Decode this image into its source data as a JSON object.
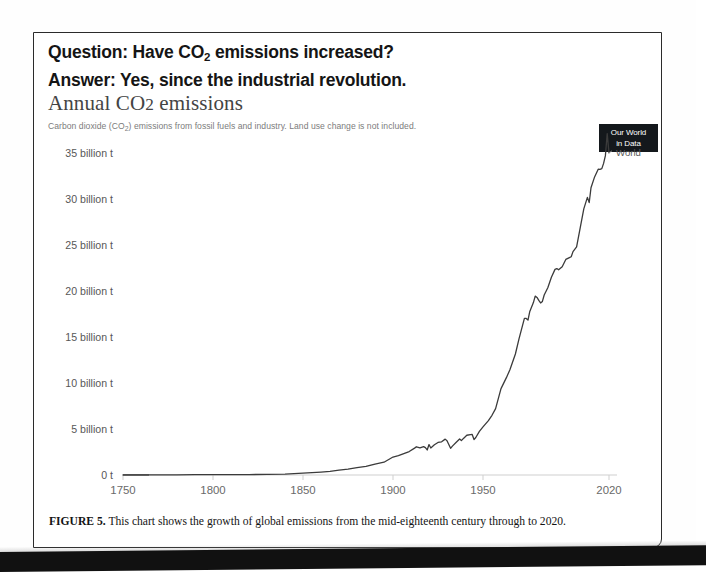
{
  "header": {
    "question_prefix": "Question: Have CO",
    "question_sub": "2",
    "question_suffix": " emissions increased?",
    "answer": "Answer: Yes, since the industrial revolution."
  },
  "chart": {
    "title_prefix": "Annual CO",
    "title_sub": "2",
    "title_suffix": " emissions",
    "subtitle_prefix": "Carbon dioxide (CO",
    "subtitle_sub": "2",
    "subtitle_suffix": ") emissions from fossil fuels and industry. Land use change is not included.",
    "logo_line1": "Our World",
    "logo_line2": "in Data",
    "series_label": "World",
    "line_color": "#3b3b3b",
    "axis_color": "#cfcfcf",
    "baseline_color": "#5a5a5a"
  },
  "caption": {
    "figure_number": "FIGURE 5.",
    "text": " This chart shows the growth of global emissions from the mid-eighteenth century through to 2020."
  },
  "chart_data": {
    "type": "line",
    "title": "Annual CO2 emissions",
    "subtitle": "Carbon dioxide (CO2) emissions from fossil fuels and industry. Land use change is not included.",
    "xlabel": "",
    "ylabel": "",
    "xlim": [
      1750,
      2020
    ],
    "ylim": [
      0,
      37.5
    ],
    "grid": false,
    "legend_position": "right-end-label",
    "x_ticks": [
      1750,
      1800,
      1850,
      1900,
      1950,
      2020
    ],
    "x_tick_labels": [
      "1750",
      "1800",
      "1850",
      "1900",
      "1950",
      "2020"
    ],
    "y_ticks": [
      0,
      5,
      10,
      15,
      20,
      25,
      30,
      35
    ],
    "y_tick_labels": [
      "0 t",
      "5 billion t",
      "10 billion t",
      "15 billion t",
      "20 billion t",
      "25 billion t",
      "30 billion t",
      "35 billion t"
    ],
    "y_unit": "billion tonnes",
    "series": [
      {
        "name": "World",
        "color": "#3b3b3b",
        "x": [
          1750,
          1760,
          1770,
          1780,
          1790,
          1800,
          1810,
          1820,
          1830,
          1840,
          1850,
          1855,
          1860,
          1865,
          1870,
          1875,
          1880,
          1885,
          1890,
          1895,
          1900,
          1903,
          1906,
          1909,
          1912,
          1913,
          1915,
          1917,
          1918,
          1919,
          1920,
          1921,
          1923,
          1925,
          1927,
          1929,
          1930,
          1931,
          1932,
          1933,
          1935,
          1937,
          1938,
          1939,
          1941,
          1943,
          1944,
          1945,
          1946,
          1948,
          1950,
          1953,
          1955,
          1957,
          1960,
          1963,
          1965,
          1968,
          1970,
          1973,
          1974,
          1975,
          1976,
          1978,
          1979,
          1980,
          1981,
          1982,
          1983,
          1984,
          1986,
          1988,
          1990,
          1991,
          1992,
          1994,
          1996,
          1998,
          1999,
          2000,
          2002,
          2004,
          2006,
          2008,
          2009,
          2010,
          2012,
          2014,
          2015,
          2016,
          2017,
          2018,
          2019,
          2020
        ],
        "y": [
          0.01,
          0.01,
          0.01,
          0.02,
          0.03,
          0.03,
          0.04,
          0.05,
          0.06,
          0.09,
          0.2,
          0.25,
          0.32,
          0.4,
          0.53,
          0.63,
          0.79,
          0.93,
          1.18,
          1.39,
          1.95,
          2.1,
          2.32,
          2.55,
          2.92,
          3.07,
          2.95,
          3.09,
          2.98,
          2.72,
          3.31,
          2.94,
          3.28,
          3.54,
          3.61,
          3.9,
          3.73,
          3.32,
          2.9,
          3.14,
          3.53,
          3.91,
          3.74,
          3.95,
          4.32,
          4.39,
          4.41,
          3.85,
          4.08,
          4.75,
          5.23,
          5.91,
          6.49,
          7.21,
          9.39,
          10.58,
          11.47,
          13.15,
          14.8,
          17.03,
          17.02,
          16.84,
          17.78,
          18.74,
          19.45,
          19.3,
          18.98,
          18.7,
          18.87,
          19.56,
          20.35,
          21.49,
          22.35,
          22.44,
          22.3,
          22.64,
          23.43,
          23.63,
          23.72,
          24.28,
          24.79,
          26.85,
          28.93,
          30.18,
          29.61,
          31.22,
          32.4,
          33.24,
          33.23,
          33.3,
          33.87,
          34.71,
          37.1,
          35.02
        ]
      }
    ]
  }
}
